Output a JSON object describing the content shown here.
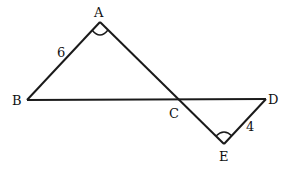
{
  "diagram": {
    "points": {
      "A": {
        "label": "A"
      },
      "B": {
        "label": "B"
      },
      "C": {
        "label": "C"
      },
      "D": {
        "label": "D"
      },
      "E": {
        "label": "E"
      }
    },
    "segments": [
      {
        "from": "A",
        "to": "B",
        "length_label": "6"
      },
      {
        "from": "B",
        "to": "D",
        "length_label": ""
      },
      {
        "from": "A",
        "to": "E",
        "length_label": ""
      },
      {
        "from": "E",
        "to": "D",
        "length_label": "4"
      }
    ],
    "angle_marks": [
      "A",
      "E"
    ],
    "colors": {
      "line": "#1a1a1a",
      "background": "#ffffff"
    }
  }
}
